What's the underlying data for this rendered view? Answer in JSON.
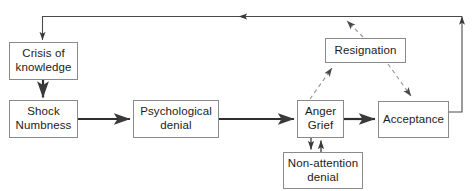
{
  "diagram": {
    "type": "flowchart",
    "title": "",
    "canvas": {
      "width": 474,
      "height": 191,
      "background": "#ffffff"
    },
    "colors": {
      "box_border": "#8a8a8a",
      "box_fill": "#ffffff",
      "solid_arrow": "#3a3a3a",
      "dashed_arrow": "#9a9a9a",
      "text": "#1b1b1b"
    },
    "nodes": [
      {
        "id": "crisis",
        "label": "Crisis of\nknowledge",
        "line1": "Crisis of",
        "line2": "knowledge",
        "x": 9,
        "y": 42,
        "w": 69,
        "h": 38
      },
      {
        "id": "shock",
        "label": "Shock\nNumbness",
        "line1": "Shock",
        "line2": "Numbness",
        "x": 9,
        "y": 100,
        "w": 69,
        "h": 38
      },
      {
        "id": "psych",
        "label": "Psychological\ndenial",
        "line1": "Psychological",
        "line2": "denial",
        "x": 133,
        "y": 100,
        "w": 86,
        "h": 38
      },
      {
        "id": "anger",
        "label": "Anger\nGrief",
        "line1": "Anger",
        "line2": "Grief",
        "x": 297,
        "y": 100,
        "w": 47,
        "h": 38
      },
      {
        "id": "acceptance",
        "label": "Acceptance",
        "line1": "Acceptance",
        "line2": "",
        "x": 378,
        "y": 101,
        "w": 71,
        "h": 37
      },
      {
        "id": "nonattention",
        "label": "Non-attention\ndenial",
        "line1": "Non-attention",
        "line2": "denial",
        "x": 283,
        "y": 152,
        "w": 80,
        "h": 37
      },
      {
        "id": "resignation",
        "label": "Resignation",
        "line1": "Resignation",
        "line2": "",
        "x": 325,
        "y": 38,
        "w": 81,
        "h": 25
      }
    ],
    "edges": [
      {
        "id": "e-feedback-top",
        "from": "acceptance",
        "to": "crisis",
        "style": "solid",
        "label": ""
      },
      {
        "id": "e-crisis-shock",
        "from": "crisis",
        "to": "shock",
        "style": "solid",
        "label": ""
      },
      {
        "id": "e-shock-psych",
        "from": "shock",
        "to": "psych",
        "style": "solid",
        "label": ""
      },
      {
        "id": "e-psych-anger",
        "from": "psych",
        "to": "anger",
        "style": "solid",
        "label": ""
      },
      {
        "id": "e-anger-accept",
        "from": "anger",
        "to": "acceptance",
        "style": "solid",
        "label": ""
      },
      {
        "id": "e-anger-nonatt",
        "from": "anger",
        "to": "nonattention",
        "style": "solid",
        "label": ""
      },
      {
        "id": "e-nonatt-anger",
        "from": "nonattention",
        "to": "anger",
        "style": "solid",
        "label": ""
      },
      {
        "id": "e-anger-resign",
        "from": "anger",
        "to": "resignation",
        "style": "dashed",
        "label": ""
      },
      {
        "id": "e-resign-accept",
        "from": "resignation",
        "to": "acceptance",
        "style": "dashed",
        "label": ""
      },
      {
        "id": "e-resign-loop",
        "from": "resignation",
        "to": "crisis",
        "style": "dashed",
        "label": ""
      }
    ]
  }
}
